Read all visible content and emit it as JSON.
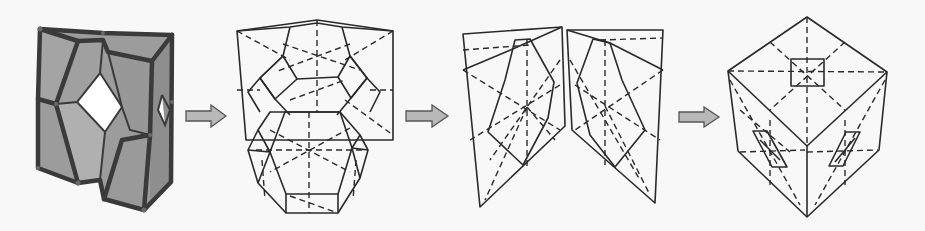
{
  "diagram": {
    "steps": [
      {
        "id": 1,
        "name": "faceted-shell",
        "fill": "#9a9a9a",
        "hole_fill": "#ffffff"
      },
      {
        "id": 2,
        "name": "net-with-truncated-polyhedron",
        "fill": "#ababab",
        "dark_fill": "#555555"
      },
      {
        "id": 3,
        "name": "mirrored-panels",
        "fill": "#a8a8a8"
      },
      {
        "id": 4,
        "name": "cube",
        "fill": "#ffffff",
        "patch_fill": "#7a7a7a"
      }
    ],
    "arrows": [
      {
        "from": 1,
        "to": 2,
        "fill": "#b8b8b8"
      },
      {
        "from": 2,
        "to": 3,
        "fill": "#b8b8b8"
      },
      {
        "from": 3,
        "to": 4,
        "fill": "#b8b8b8"
      }
    ],
    "colors": {
      "background": "#f8f8f8",
      "stroke": "#2a2a2a",
      "gray_face": "#a9a9a9",
      "dark_face": "#555555",
      "arrow": "#b8b8b8"
    }
  }
}
